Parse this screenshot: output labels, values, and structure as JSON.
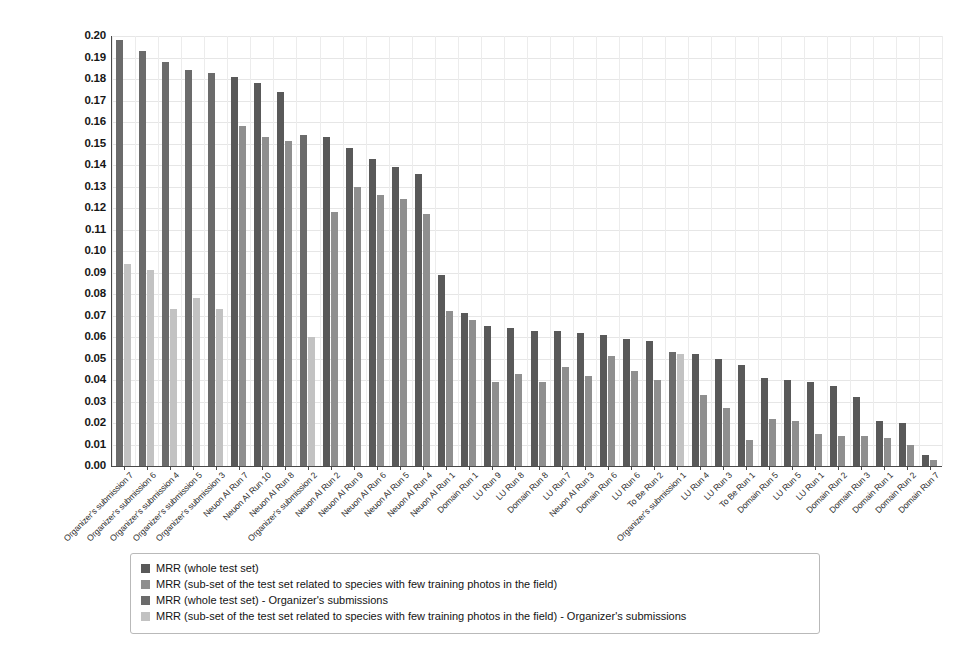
{
  "chart_data": {
    "type": "bar",
    "title": "",
    "xlabel": "",
    "ylabel": "",
    "ylim": [
      0.0,
      0.2
    ],
    "ytick_step": 0.01,
    "grid": true,
    "legend_position": "bottom",
    "ytick_labels": [
      "0.20",
      "0.19",
      "0.18",
      "0.17",
      "0.16",
      "0.15",
      "0.14",
      "0.13",
      "0.12",
      "0.11",
      "0.10",
      "0.09",
      "0.08",
      "0.07",
      "0.06",
      "0.05",
      "0.04",
      "0.03",
      "0.02",
      "0.01",
      "0.00"
    ],
    "categories": [
      "Organizer's submission 7",
      "Organizer's submission 6",
      "Organizer's submission 4",
      "Organizer's submission 5",
      "Organizer's submission 3",
      "Neuon AI Run 7",
      "Neuon AI Run 10",
      "Neuon AI Run 8",
      "Organizer's submission 2",
      "Neuon AI Run 2",
      "Neuon AI Run 9",
      "Neuon AI Run 6",
      "Neuon AI Run 5",
      "Neuon AI Run 4",
      "Neuon AI Run 1",
      "Domain Run 1",
      "LU Run 9",
      "LU Run 8",
      "Domain Run 8",
      "LU Run 7",
      "Neuon AI Run 3",
      "Domain Run 6",
      "LU Run 6",
      "To Be Run 2",
      "Organizer's submission 1",
      "LU Run 4",
      "LU Run 3",
      "To Be Run 1",
      "Domain Run 5",
      "LU Run 5",
      "LU Run 1",
      "Domain Run 2",
      "Domain Run 3",
      "Domain Run 1",
      "Domain Run 2",
      "Domain Run 7"
    ],
    "is_organizer": [
      true,
      true,
      true,
      true,
      true,
      false,
      false,
      false,
      true,
      false,
      false,
      false,
      false,
      false,
      false,
      false,
      false,
      false,
      false,
      false,
      false,
      false,
      false,
      false,
      true,
      false,
      false,
      false,
      false,
      false,
      false,
      false,
      false,
      false,
      false,
      false
    ],
    "series": [
      {
        "name": "MRR (whole test set)",
        "color": "#595959",
        "values": [
          0.198,
          0.193,
          0.188,
          0.184,
          0.183,
          0.181,
          0.178,
          0.174,
          0.154,
          0.153,
          0.148,
          0.143,
          0.139,
          0.136,
          0.089,
          0.071,
          0.065,
          0.064,
          0.063,
          0.063,
          0.062,
          0.061,
          0.059,
          0.058,
          0.053,
          0.052,
          0.05,
          0.047,
          0.041,
          0.04,
          0.039,
          0.037,
          0.032,
          0.021,
          0.02,
          0.005
        ]
      },
      {
        "name": "MRR (sub-set of the test set related to species with few training photos in the field)",
        "color": "#8f8f8f",
        "values": [
          0.094,
          0.091,
          0.073,
          0.078,
          0.073,
          0.158,
          0.153,
          0.151,
          0.06,
          0.118,
          0.13,
          0.126,
          0.124,
          0.117,
          0.072,
          0.068,
          0.039,
          0.043,
          0.039,
          0.046,
          0.042,
          0.051,
          0.044,
          0.04,
          0.052,
          0.033,
          0.027,
          0.012,
          0.022,
          0.021,
          0.015,
          0.014,
          0.014,
          0.013,
          0.01,
          0.003
        ]
      }
    ],
    "legend": [
      {
        "label": "MRR (whole test set)",
        "color": "#595959"
      },
      {
        "label": "MRR (sub-set of the test set related to species with few training photos in the field)",
        "color": "#8f8f8f"
      },
      {
        "label": "MRR (whole test set) - Organizer's submissions",
        "color": "#6b6b6b"
      },
      {
        "label": "MRR (sub-set of the test set related to species with few training photos in the field) - Organizer's submissions",
        "color": "#c2c2c2"
      }
    ]
  }
}
